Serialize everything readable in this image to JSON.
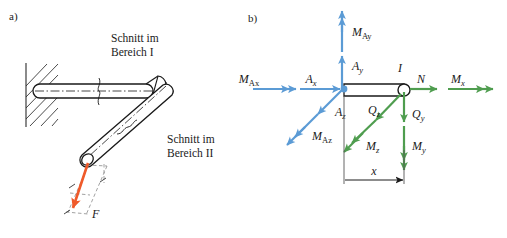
{
  "figure": {
    "width": 507,
    "height": 238,
    "background": "#ffffff"
  },
  "colors": {
    "outline": "#1a1a1a",
    "blue": "#5b9bd5",
    "green": "#4f9d4f",
    "orange": "#ef5a2a",
    "dashed": "#8a8a8a",
    "hatch": "#2b2b2b"
  },
  "panel_a": {
    "tag": "a)",
    "captions": [
      {
        "line1": "Schnitt im",
        "line2": "Bereich I"
      },
      {
        "line1": "Schnitt im",
        "line2": "Bereich II"
      }
    ],
    "caption_1_line1": "Schnitt im",
    "caption_1_line2": "Bereich I",
    "caption_2_line1": "Schnitt im",
    "caption_2_line2": "Bereich II",
    "force_label": "F",
    "force_color": "#ef5a2a",
    "description": "Cantilever rod fixed in hatched wall, bent downward, loaded by force F"
  },
  "panel_b": {
    "tag": "b)",
    "node_label": "I",
    "dimension_label": "x",
    "support_reactions": {
      "color": "#5b9bd5",
      "items": [
        {
          "name": "M-Ax",
          "base": "M",
          "sub": "Ax",
          "heads": 2,
          "dir": "right",
          "label": "MAx"
        },
        {
          "name": "A-x",
          "base": "A",
          "sub": "x",
          "heads": 1,
          "dir": "right",
          "label": "Ax"
        },
        {
          "name": "M-Ay",
          "base": "M",
          "sub": "Ay",
          "heads": 2,
          "dir": "up",
          "label": "MAy"
        },
        {
          "name": "A-y",
          "base": "A",
          "sub": "y",
          "heads": 1,
          "dir": "up",
          "label": "Ay"
        },
        {
          "name": "M-Az",
          "base": "M",
          "sub": "Az",
          "heads": 2,
          "dir": "down-left",
          "label": "MAz"
        },
        {
          "name": "A-z",
          "base": "A",
          "sub": "z",
          "heads": 1,
          "dir": "down-left",
          "label": "Az"
        }
      ]
    },
    "internal_forces": {
      "color": "#4f9d4f",
      "items": [
        {
          "name": "N",
          "base": "N",
          "sub": "",
          "heads": 1,
          "dir": "right",
          "label": "N"
        },
        {
          "name": "M-x",
          "base": "M",
          "sub": "x",
          "heads": 2,
          "dir": "right",
          "label": "Mx"
        },
        {
          "name": "Q-y",
          "base": "Q",
          "sub": "y",
          "heads": 1,
          "dir": "down",
          "label": "Qy"
        },
        {
          "name": "M-y",
          "base": "M",
          "sub": "y",
          "heads": 2,
          "dir": "down",
          "label": "My"
        },
        {
          "name": "Q-z",
          "base": "Q",
          "sub": "z",
          "heads": 1,
          "dir": "down-left",
          "label": "Qz"
        },
        {
          "name": "M-z",
          "base": "M",
          "sub": "z",
          "heads": 2,
          "dir": "down-left",
          "label": "Mz"
        }
      ]
    }
  }
}
